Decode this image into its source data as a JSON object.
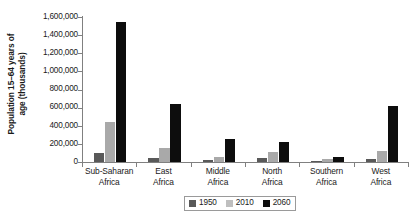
{
  "chart_data": {
    "type": "bar",
    "title": "",
    "xlabel": "",
    "ylabel": "Population 15–64 years of age (thousands)",
    "ylabel_lines": [
      "Population 15–64 years of",
      "age (thousands)"
    ],
    "categories": [
      "Sub-Saharan Africa",
      "East Africa",
      "Middle Africa",
      "North Africa",
      "Southern Africa",
      "West Africa"
    ],
    "category_lines": [
      [
        "Sub-Saharan",
        "Africa"
      ],
      [
        "East",
        "Africa"
      ],
      [
        "Middle",
        "Africa"
      ],
      [
        "North",
        "Africa"
      ],
      [
        "Southern",
        "Africa"
      ],
      [
        "West",
        "Africa"
      ]
    ],
    "series": [
      {
        "name": "1950",
        "color": "#595959",
        "values": [
          100000,
          40000,
          20000,
          45000,
          12000,
          35000
        ]
      },
      {
        "name": "2010",
        "color": "#a9a9a9",
        "values": [
          440000,
          160000,
          60000,
          115000,
          35000,
          120000
        ]
      },
      {
        "name": "2060",
        "color": "#0d0d0d",
        "values": [
          1550000,
          640000,
          250000,
          220000,
          52000,
          620000
        ]
      }
    ],
    "ylim": [
      0,
      1600000
    ],
    "ytick_step": 200000,
    "yticks": [
      0,
      200000,
      400000,
      600000,
      800000,
      1000000,
      1200000,
      1400000,
      1600000
    ],
    "ytick_labels": [
      "0",
      "200,000",
      "400,000",
      "600,000",
      "800,000",
      "1,000,000",
      "1,200,000",
      "1,400,000",
      "1,600,000"
    ],
    "grid": false,
    "legend_position": "bottom-center",
    "legend_entries": [
      "1950",
      "2010",
      "2060"
    ]
  }
}
